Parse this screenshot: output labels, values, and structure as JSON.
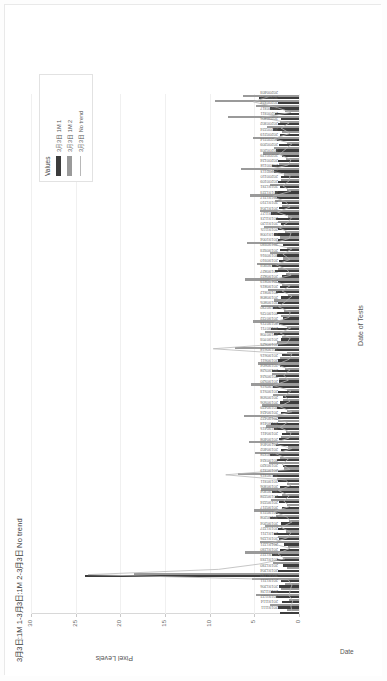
{
  "figure": {
    "title": "3月3日:1M 1-3月3日:1M 2-3月3日 No trend",
    "corner_label": "Date"
  },
  "legend": {
    "title": "Values",
    "items": [
      {
        "label": "3月3日 1M 1",
        "color": "#3c3c3c",
        "style": "bar"
      },
      {
        "label": "3月3日 1M 2",
        "color": "#9a9a9a",
        "style": "bar"
      },
      {
        "label": "3月3日 No trend",
        "color": "#b8b8b8",
        "style": "line"
      }
    ]
  },
  "chart_data": {
    "type": "bar",
    "title": "3月3日:1M 1-3月3日:1M 2-3月3日 No trend",
    "xlabel": "Date of Tests",
    "ylabel": "Pixel Levels",
    "ylim": [
      0,
      30
    ],
    "yticks": [
      0,
      5,
      10,
      15,
      20,
      25,
      30
    ],
    "grid": true,
    "legend_position": "top-right",
    "categories": [
      "20191111",
      "20191114",
      "20191122",
      "20191128",
      "20191206",
      "20191211",
      "20191220",
      "20191204",
      "20191230",
      "20191233",
      "20191227",
      "20191230",
      "20191221",
      "20191226",
      "20191211",
      "20191227",
      "20190204",
      "20190208",
      "20190213",
      "20190217",
      "20190224",
      "20190228",
      "20190304",
      "20190306",
      "20190311",
      "20190315",
      "20190319",
      "20190320",
      "20190324",
      "20190328",
      "20190402",
      "20190404",
      "20190408",
      "20190411",
      "20190415",
      "20190418",
      "20190422",
      "20190424",
      "20190429",
      "20190506",
      "20190508",
      "20190513",
      "20190515",
      "20190520",
      "20190524",
      "20190528",
      "20190604",
      "20190611",
      "20190615",
      "20190618",
      "20190625",
      "20190703",
      "20190708",
      "20190711",
      "20190715",
      "20190722",
      "20190725",
      "20190730",
      "20190805",
      "20190808",
      "20190812",
      "20190815",
      "20190819",
      "20190822",
      "20190827",
      "20190903",
      "20190910",
      "20190916",
      "20190923",
      "20190930",
      "20191004",
      "20191008",
      "20191115",
      "20191120",
      "20191123",
      "20191127",
      "20191204",
      "20191210",
      "20191217",
      "20191223",
      "20191231",
      "20200109",
      "20200110",
      "20200113",
      "20200118",
      "20200124",
      "20200129",
      "20200203",
      "20200209",
      "20200214",
      "20200219",
      "20200224",
      "20200302",
      "20200306",
      "20200311",
      "20200317",
      "20200324",
      "20200327",
      "20200403"
    ],
    "series": [
      {
        "name": "3月3日 1M 1",
        "color": "#3c3c3c",
        "values": [
          2.1,
          2.4,
          1.9,
          2.6,
          3.1,
          2.2,
          2.0,
          24.0,
          2.3,
          1.8,
          2.5,
          3.0,
          2.1,
          1.7,
          2.2,
          2.8,
          2.4,
          2.0,
          3.3,
          2.6,
          1.9,
          2.2,
          2.7,
          3.0,
          2.1,
          2.4,
          2.9,
          2.3,
          1.8,
          2.5,
          3.2,
          2.0,
          2.6,
          2.2,
          1.9,
          2.8,
          3.1,
          2.3,
          2.0,
          2.5,
          2.1,
          1.8,
          2.4,
          2.9,
          2.2,
          2.6,
          3.0,
          2.1,
          2.3,
          1.9,
          2.7,
          2.4,
          2.0,
          2.8,
          3.1,
          2.2,
          1.8,
          2.5,
          2.9,
          2.3,
          2.0,
          2.6,
          2.1,
          2.4,
          1.9,
          2.7,
          3.0,
          2.2,
          2.5,
          2.1,
          1.8,
          2.4,
          2.8,
          2.3,
          2.0,
          2.6,
          3.1,
          2.2,
          1.9,
          2.5,
          2.7,
          2.1,
          2.4,
          2.0,
          2.8,
          3.0,
          2.3,
          1.9,
          2.6,
          2.2,
          2.5,
          2.1,
          2.9,
          2.4,
          2.0,
          2.7,
          3.2,
          2.3,
          4.5
        ]
      },
      {
        "name": "3月3日 1M 2",
        "color": "#9a9a9a",
        "values": [
          1.4,
          3.2,
          1.1,
          4.8,
          2.0,
          1.6,
          5.3,
          18.5,
          1.3,
          2.9,
          1.8,
          6.1,
          1.2,
          4.4,
          2.3,
          1.5,
          3.8,
          1.1,
          2.6,
          5.0,
          1.4,
          3.1,
          1.9,
          4.2,
          1.3,
          2.5,
          6.8,
          1.7,
          3.4,
          2.1,
          4.9,
          1.2,
          5.6,
          2.0,
          1.5,
          3.7,
          2.4,
          6.2,
          1.3,
          4.1,
          1.8,
          2.9,
          1.4,
          5.4,
          2.2,
          3.0,
          1.6,
          4.6,
          2.1,
          1.3,
          7.2,
          2.5,
          1.9,
          3.8,
          1.4,
          5.1,
          2.0,
          1.7,
          4.3,
          2.8,
          1.2,
          3.5,
          1.9,
          6.0,
          1.5,
          2.3,
          4.7,
          1.8,
          3.2,
          1.3,
          5.8,
          2.1,
          1.6,
          3.9,
          2.4,
          1.2,
          4.4,
          1.9,
          2.7,
          5.5,
          1.4,
          3.3,
          2.0,
          1.7,
          6.5,
          2.2,
          1.5,
          4.0,
          2.8,
          1.3,
          5.2,
          1.9,
          3.6,
          2.1,
          7.9,
          1.6,
          4.8,
          9.4,
          6.3
        ]
      },
      {
        "name": "3月3日 No trend",
        "color": "#b8b8b8",
        "values": [
          0.8,
          0.9,
          0.7,
          1.1,
          1.0,
          0.8,
          1.2,
          23.6,
          9.0,
          4.5,
          1.6,
          2.4,
          1.0,
          3.2,
          1.3,
          0.9,
          2.0,
          0.8,
          1.4,
          2.8,
          1.0,
          1.7,
          1.1,
          2.3,
          0.9,
          1.5,
          8.2,
          1.0,
          1.9,
          1.2,
          2.6,
          0.8,
          3.0,
          1.1,
          0.9,
          2.1,
          1.3,
          3.4,
          0.8,
          2.2,
          1.0,
          1.6,
          0.9,
          2.9,
          1.2,
          1.7,
          1.0,
          2.5,
          1.1,
          0.8,
          9.6,
          1.4,
          1.0,
          2.1,
          0.9,
          2.8,
          1.1,
          1.0,
          2.3,
          1.5,
          0.8,
          1.9,
          1.0,
          3.3,
          0.9,
          1.3,
          2.6,
          1.0,
          1.8,
          0.8,
          3.1,
          1.1,
          0.9,
          2.2,
          1.3,
          0.8,
          2.4,
          1.0,
          1.5,
          3.0,
          0.9,
          1.8,
          1.1,
          1.0,
          3.6,
          1.2,
          0.9,
          2.2,
          1.5,
          0.8,
          2.8,
          1.0,
          2.0,
          1.1,
          4.2,
          0.9,
          2.6,
          5.1,
          3.4
        ]
      }
    ]
  }
}
